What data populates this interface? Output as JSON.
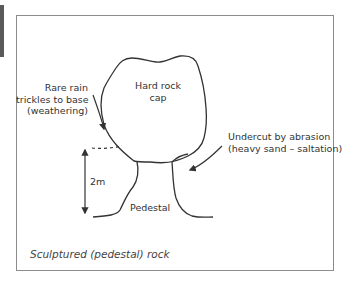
{
  "figure": {
    "caption": "Sculptured (pedestal) rock",
    "labels": {
      "cap": [
        "Hard rock",
        "cap"
      ],
      "rain": [
        "Rare rain",
        "trickles to base",
        "(weathering)"
      ],
      "abrasion": [
        "Undercut by abrasion",
        "(heavy sand – saltation)"
      ],
      "height": "2m",
      "pedestal": "Pedestal"
    },
    "colors": {
      "line": "#333333",
      "frame": "#8c8c8c",
      "side_bar": "#5a5a5a"
    }
  }
}
